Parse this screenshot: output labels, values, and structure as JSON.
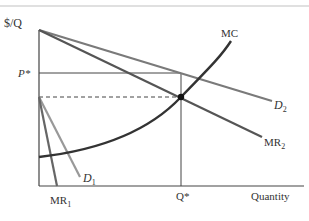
{
  "axes": {
    "y_label": "$/Q",
    "x_label": "Quantity"
  },
  "markers": {
    "price": "P*",
    "quantity": "Q*"
  },
  "curves": {
    "mc": {
      "label": "MC",
      "color": "#333333"
    },
    "d2": {
      "label": "D",
      "sub": "2",
      "color": "#7a7a7a"
    },
    "mr2": {
      "label": "MR",
      "sub": "2",
      "color": "#555555"
    },
    "d1": {
      "label": "D",
      "sub": "1",
      "color": "#999999"
    },
    "mr1": {
      "label": "MR",
      "sub": "1",
      "color": "#666666"
    }
  }
}
